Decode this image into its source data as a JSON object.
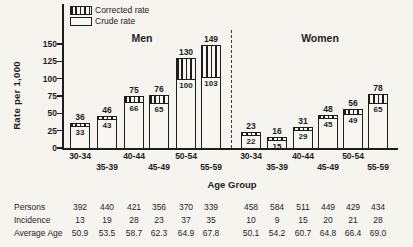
{
  "colors": {
    "ink": "#1d1d1d",
    "paper": "#f5f4ef",
    "bar_fill": "#f7f6f1"
  },
  "chart_data": {
    "type": "bar",
    "title": "",
    "ylabel": "Rate per 1,000",
    "xlabel": "Age Group",
    "ylim": [
      0,
      150
    ],
    "yticks": [
      0,
      25,
      50,
      75,
      100,
      125,
      150
    ],
    "legend": [
      {
        "label": "Corrected rate",
        "style": "hatched"
      },
      {
        "label": "Crude rate",
        "style": "open"
      }
    ],
    "legend_position": "top-left",
    "grid": false,
    "note": "Each bar: open lower segment = crude rate, hatched top segment = corrected rate total; total labeled above bar, crude labeled inside bar",
    "groups": [
      {
        "name": "Men",
        "categories": [
          "30-34",
          "35-39",
          "40-44",
          "45-49",
          "50-54",
          "55-59"
        ],
        "series": [
          {
            "name": "Corrected rate",
            "values": [
              36,
              46,
              75,
              76,
              130,
              149
            ]
          },
          {
            "name": "Crude rate",
            "values": [
              33,
              43,
              66,
              65,
              100,
              103
            ]
          }
        ]
      },
      {
        "name": "Women",
        "categories": [
          "30-34",
          "35-39",
          "40-44",
          "45-49",
          "50-54",
          "55-59"
        ],
        "series": [
          {
            "name": "Corrected rate",
            "values": [
              23,
              16,
              31,
              48,
              56,
              78
            ]
          },
          {
            "name": "Crude rate",
            "values": [
              22,
              15,
              29,
              45,
              49,
              65
            ]
          }
        ]
      }
    ]
  },
  "table": {
    "rows": [
      {
        "label": "Persons",
        "men": [
          "392",
          "440",
          "421",
          "356",
          "370",
          "339"
        ],
        "women": [
          "458",
          "584",
          "511",
          "449",
          "429",
          "434"
        ]
      },
      {
        "label": "Incidence",
        "men": [
          "13",
          "19",
          "28",
          "23",
          "37",
          "35"
        ],
        "women": [
          "10",
          "9",
          "15",
          "20",
          "21",
          "28"
        ]
      },
      {
        "label": "Average Age",
        "men": [
          "50.9",
          "53.5",
          "58.7",
          "62.3",
          "64.9",
          "67.8"
        ],
        "women": [
          "50.1",
          "54.2",
          "60.7",
          "64.8",
          "66.4",
          "69.0"
        ]
      }
    ]
  }
}
